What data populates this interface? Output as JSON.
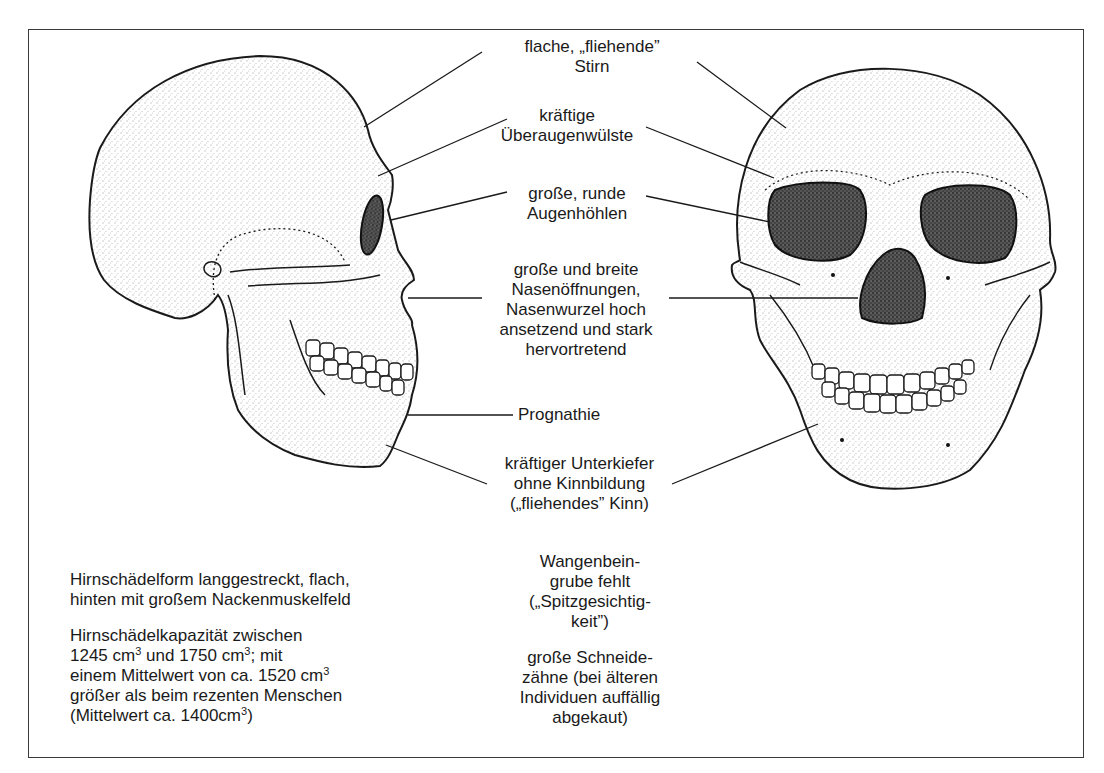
{
  "figure": {
    "views": [
      "lateral-skull",
      "frontal-skull"
    ],
    "colors": {
      "ink": "#1a1a1a",
      "frame": "#3a3a3a",
      "background": "#ffffff",
      "orbit_fill": "#3c3c3c"
    }
  },
  "labels": {
    "forehead": {
      "lines": [
        "flache, „fliehende”",
        "Stirn"
      ]
    },
    "brow_ridges": {
      "lines": [
        "kräftige",
        "Überaugenwülste"
      ]
    },
    "orbits": {
      "lines": [
        "große, runde",
        "Augenhöhlen"
      ]
    },
    "nose": {
      "lines": [
        "große und breite",
        "Nasenöffnungen,",
        "Nasenwurzel hoch",
        "ansetzend und stark",
        "hervortretend"
      ]
    },
    "prognathism": {
      "lines": [
        "Prognathie"
      ]
    },
    "jaw": {
      "lines": [
        "kräftiger Unterkiefer",
        "ohne Kinnbildung",
        "(„fliehendes” Kinn)"
      ]
    }
  },
  "notes_left": {
    "shape": [
      "Hirnschädelform langgestreckt, flach,",
      "hinten mit großem Nackenmuskelfeld"
    ],
    "capacity": {
      "line1": "Hirnschädelkapazität zwischen",
      "line2_a": "1245 cm",
      "line2_sup1": "3",
      "line2_b": " und 1750 cm",
      "line2_sup2": "3",
      "line2_c": "; mit",
      "line3_a": "einem Mittelwert von ca. 1520 cm",
      "line3_sup": "3",
      "line4": "größer als beim rezenten Menschen",
      "line5_a": "(Mittelwert ca. 1400cm",
      "line5_sup": "3",
      "line5_b": ")"
    }
  },
  "notes_center": {
    "cheek": [
      "Wangenbein-",
      "grube fehlt",
      "(„Spitzgesichtig-",
      "keit”)"
    ],
    "teeth": [
      "große Schneide-",
      "zähne (bei älteren",
      "Individuen auffällig",
      "abgekaut)"
    ]
  }
}
